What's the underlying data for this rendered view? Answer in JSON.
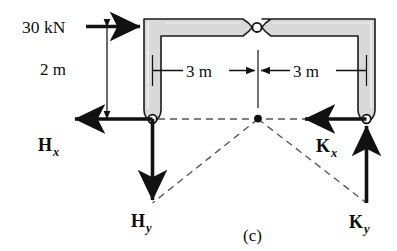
{
  "figure": {
    "caption": "(c)",
    "colors": {
      "member_fill": "#d9d9d9",
      "member_stroke": "#1a1a1a",
      "line": "#111111",
      "dashed": "#555555",
      "background": "#ffffff"
    }
  },
  "loads": [
    {
      "id": "applied-load",
      "label": "30 kN",
      "magnitude": 30,
      "unit": "kN",
      "direction": "right",
      "applied_at": "top-left-corner"
    }
  ],
  "dimensions": [
    {
      "id": "dim-vertical",
      "label": "2 m",
      "value": 2,
      "unit": "m",
      "orientation": "vertical",
      "description": "column height from support to top beam"
    },
    {
      "id": "dim-horizontal-left",
      "label": "3 m",
      "value": 3,
      "unit": "m",
      "orientation": "horizontal",
      "description": "left support to center hinge"
    },
    {
      "id": "dim-horizontal-right",
      "label": "3 m",
      "value": 3,
      "unit": "m",
      "orientation": "horizontal",
      "description": "center hinge to right support"
    }
  ],
  "reactions": [
    {
      "id": "reaction-hx",
      "symbol": "H",
      "subscript": "x",
      "support": "H",
      "component": "horizontal",
      "direction": "left"
    },
    {
      "id": "reaction-hy",
      "symbol": "H",
      "subscript": "y",
      "support": "H",
      "component": "vertical",
      "direction": "down"
    },
    {
      "id": "reaction-kx",
      "symbol": "K",
      "subscript": "x",
      "support": "K",
      "component": "horizontal",
      "direction": "left"
    },
    {
      "id": "reaction-ky",
      "symbol": "K",
      "subscript": "y",
      "support": "K",
      "component": "vertical",
      "direction": "up"
    }
  ],
  "joints": [
    {
      "id": "hinge-center",
      "type": "pin",
      "location": "top-center-of-beam"
    },
    {
      "id": "support-h",
      "type": "pin-support",
      "location": "bottom-left"
    },
    {
      "id": "support-k",
      "type": "pin-support",
      "location": "bottom-right"
    },
    {
      "id": "resultant-point",
      "type": "intersection-point",
      "location": "center-below-hinge"
    }
  ]
}
